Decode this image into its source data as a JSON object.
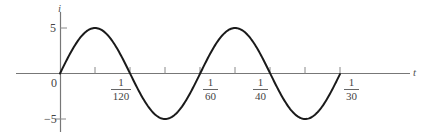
{
  "chart_data": {
    "type": "line",
    "title": "",
    "xlabel": "t",
    "ylabel": "i",
    "function": "i = 5 sin(120πt)",
    "amplitude": 5,
    "frequency_hz": 60,
    "xlim": [
      0,
      0.0333
    ],
    "ylim": [
      -5,
      5
    ],
    "grid": false,
    "legend": null,
    "y_ticks": [
      {
        "value": 5,
        "label": "5"
      },
      {
        "value": -5,
        "label": "−5"
      }
    ],
    "x_ticks": [
      {
        "value": 0,
        "label": "0"
      },
      {
        "value": 0.004167,
        "label": ""
      },
      {
        "value": 0.008333,
        "label": "1/120",
        "num": "1",
        "den": "120"
      },
      {
        "value": 0.0125,
        "label": ""
      },
      {
        "value": 0.016667,
        "label": "1/60",
        "num": "1",
        "den": "60"
      },
      {
        "value": 0.020833,
        "label": ""
      },
      {
        "value": 0.025,
        "label": "1/40",
        "num": "1",
        "den": "40"
      },
      {
        "value": 0.029167,
        "label": ""
      },
      {
        "value": 0.033333,
        "label": "1/30",
        "num": "1",
        "den": "30"
      }
    ],
    "x": [
      0,
      0.004167,
      0.008333,
      0.0125,
      0.016667,
      0.020833,
      0.025,
      0.029167,
      0.033333
    ],
    "series": [
      {
        "name": "i(t)",
        "values": [
          0,
          5,
          0,
          -5,
          0,
          5,
          0,
          -5,
          0
        ],
        "color": "#1a1a1a"
      }
    ]
  },
  "labels": {
    "y_axis_name": "i",
    "x_axis_name": "t",
    "origin": "0",
    "y_pos": "5",
    "y_neg": "−5",
    "f120": {
      "num": "1",
      "den": "120"
    },
    "f60": {
      "num": "1",
      "den": "60"
    },
    "f40": {
      "num": "1",
      "den": "40"
    },
    "f30": {
      "num": "1",
      "den": "30"
    }
  }
}
